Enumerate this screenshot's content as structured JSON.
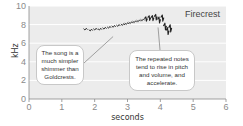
{
  "chart_data": {
    "type": "scatter",
    "title": "Firecrest",
    "xlabel": "seconds",
    "ylabel": "kHz",
    "xlim": [
      0,
      6
    ],
    "ylim": [
      0,
      10
    ],
    "xticks": [
      "0",
      "1",
      "2",
      "3",
      "4",
      "5",
      "6"
    ],
    "yticks": [
      "0",
      "2",
      "4",
      "6",
      "8",
      "10"
    ],
    "grid": true,
    "series": [
      {
        "name": "Firecrest song notes",
        "points": [
          {
            "t": 1.72,
            "f": 7.5
          },
          {
            "t": 1.88,
            "f": 7.4
          },
          {
            "t": 2.02,
            "f": 7.5
          },
          {
            "t": 2.16,
            "f": 7.5
          },
          {
            "t": 2.3,
            "f": 7.6
          },
          {
            "t": 2.44,
            "f": 7.7
          },
          {
            "t": 2.58,
            "f": 7.8
          },
          {
            "t": 2.72,
            "f": 7.9
          },
          {
            "t": 2.86,
            "f": 8.0
          },
          {
            "t": 2.98,
            "f": 8.1
          },
          {
            "t": 3.1,
            "f": 8.2
          },
          {
            "t": 3.22,
            "f": 8.3
          },
          {
            "t": 3.34,
            "f": 8.4
          },
          {
            "t": 3.46,
            "f": 8.5
          },
          {
            "t": 3.56,
            "f": 8.6
          },
          {
            "t": 3.66,
            "f": 8.7
          },
          {
            "t": 3.76,
            "f": 8.7
          },
          {
            "t": 3.86,
            "f": 8.8
          },
          {
            "t": 3.96,
            "f": 8.5
          },
          {
            "t": 4.06,
            "f": 8.7
          },
          {
            "t": 4.14,
            "f": 7.8
          },
          {
            "t": 4.22,
            "f": 7.3
          },
          {
            "t": 4.3,
            "f": 7.6
          }
        ]
      }
    ],
    "annotations": [
      {
        "text_lines": [
          "The song is a",
          "much simpler",
          "shimmer than",
          "Goldcrests."
        ],
        "points_to": {
          "t": 2.5,
          "f": 6.5
        }
      },
      {
        "text_lines": [
          "The repeated notes",
          "tend to rise in pitch",
          "and volume, and",
          "accelerate."
        ],
        "points_to": {
          "t": 3.9,
          "f": 7.8
        }
      }
    ],
    "legend": "top-right"
  }
}
